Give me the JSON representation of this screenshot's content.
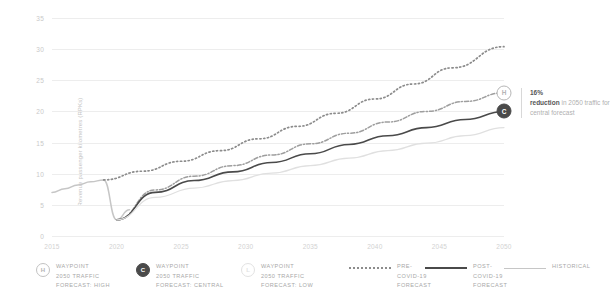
{
  "chart_data": {
    "type": "line",
    "title": "",
    "xlabel": "",
    "ylabel": "Revenue passenger kilometres (RPKs)",
    "xlim": [
      2015,
      2050
    ],
    "ylim": [
      0,
      35
    ],
    "grid": true,
    "legend_position": "bottom",
    "x_ticks": [
      "2015",
      "2020",
      "2025",
      "2030",
      "2035",
      "2040",
      "2045",
      "2050"
    ],
    "y_ticks": [
      "35",
      "30",
      "25",
      "20",
      "15",
      "10",
      "5",
      "0"
    ],
    "x": [
      2015,
      2016,
      2017,
      2018,
      2019,
      2020,
      2021,
      2022,
      2023,
      2024,
      2025,
      2026,
      2027,
      2028,
      2029,
      2030,
      2031,
      2032,
      2033,
      2034,
      2035,
      2036,
      2037,
      2038,
      2039,
      2040,
      2041,
      2042,
      2043,
      2044,
      2045,
      2046,
      2047,
      2048,
      2049,
      2050
    ],
    "series": [
      {
        "name": "Historical",
        "style": "solid-light",
        "color": "#c6c6c6",
        "x": [
          2015,
          2016,
          2017,
          2018,
          2019,
          2020,
          2021
        ],
        "values": [
          7.0,
          7.6,
          8.2,
          8.7,
          9.0,
          2.6,
          4.2
        ]
      },
      {
        "name": "Pre-COVID-19 forecast",
        "style": "dotted",
        "color": "#8c8c8c",
        "x": [
          2019,
          2022,
          2025,
          2028,
          2031,
          2034,
          2037,
          2040,
          2043,
          2046,
          2050
        ],
        "values": [
          9.0,
          10.4,
          12.0,
          13.7,
          15.6,
          17.6,
          19.7,
          22.0,
          24.4,
          27.0,
          30.4
        ]
      },
      {
        "name": "Waypoint 2050 traffic forecast: high",
        "style": "dash-dot",
        "color": "#9e9e9e",
        "marker_label": "H",
        "x": [
          2020,
          2023,
          2026,
          2029,
          2032,
          2035,
          2038,
          2041,
          2044,
          2047,
          2050
        ],
        "values": [
          2.6,
          7.4,
          9.6,
          11.3,
          13.0,
          14.8,
          16.5,
          18.3,
          20.0,
          21.6,
          23.0
        ]
      },
      {
        "name": "Post-COVID-19 forecast (central)",
        "style": "solid-dark",
        "color": "#4a4a4a",
        "marker_label": "C",
        "x": [
          2020,
          2023,
          2026,
          2029,
          2032,
          2035,
          2038,
          2041,
          2044,
          2047,
          2050
        ],
        "values": [
          2.6,
          7.0,
          8.9,
          10.3,
          11.8,
          13.2,
          14.7,
          16.1,
          17.4,
          18.7,
          20.0
        ]
      },
      {
        "name": "Waypoint 2050 traffic forecast: low",
        "style": "solid-faint",
        "color": "#e0e0e0",
        "marker_label": "L",
        "x": [
          2020,
          2023,
          2026,
          2029,
          2032,
          2035,
          2038,
          2041,
          2044,
          2047,
          2050
        ],
        "values": [
          2.6,
          6.2,
          7.7,
          8.9,
          10.1,
          11.3,
          12.5,
          13.7,
          14.9,
          16.1,
          17.4
        ]
      }
    ],
    "endpoint_markers": [
      {
        "label": "H",
        "year": 2050,
        "value": 23.0
      },
      {
        "label": "C",
        "year": 2050,
        "value": 20.0
      }
    ],
    "annotation": {
      "highlight": "16%",
      "bold": "reduction",
      "rest": " in 2050 traffic for central forecast"
    }
  },
  "axis": {
    "y_title": "Revenue passenger kilometres (RPKs)"
  },
  "legend": {
    "items": [
      {
        "badge": "H",
        "label": "WAYPOINT\n2050 TRAFFIC\nFORECAST: HIGH"
      },
      {
        "badge": "C",
        "label": "WAYPOINT\n2050 TRAFFIC\nFORECAST: CENTRAL"
      },
      {
        "badge": "L",
        "label": "WAYPOINT\n2050 TRAFFIC\nFORECAST: LOW"
      },
      {
        "swatch": "dotted",
        "label": "PRE-COVID-19\nFORECAST"
      },
      {
        "swatch": "solid",
        "label": "POST-COVID-19\nFORECAST"
      },
      {
        "swatch": "historical",
        "label": "HISTORICAL"
      }
    ]
  }
}
